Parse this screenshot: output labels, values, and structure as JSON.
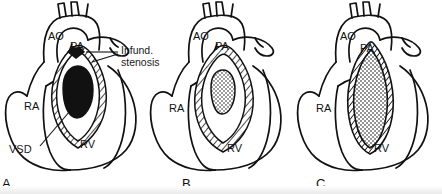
{
  "figure": {
    "background_color": "#ffffff",
    "ink_color": "#111111"
  },
  "panels": [
    {
      "id": "A",
      "letter": "A",
      "description": "Heart with large ventricular septal defect shown as solid black region and infundibular stenosis",
      "labels": {
        "aorta": "AO",
        "pulmonary_artery": "PA",
        "right_atrium": "RA",
        "right_ventricle": "RV"
      },
      "fill_style": "solid-black",
      "callouts": [
        {
          "name": "infundibular-stenosis",
          "text": "Infund.\nstenosis"
        },
        {
          "name": "ventricular-septal-defect",
          "text": "VSD"
        }
      ]
    },
    {
      "id": "B",
      "letter": "B",
      "description": "Heart with small stippled outflow chamber bounded by hatched muscular walls",
      "labels": {
        "aorta": "AO",
        "pulmonary_artery": "PA",
        "right_atrium": "RA",
        "right_ventricle": "RV"
      },
      "fill_style": "stippled-small",
      "callouts": []
    },
    {
      "id": "C",
      "letter": "C",
      "description": "Heart with large elongated stippled outflow chamber bounded by thick hatched walls",
      "labels": {
        "aorta": "AO",
        "pulmonary_artery": "PA",
        "right_atrium": "RA",
        "right_ventricle": "RV"
      },
      "fill_style": "stippled-large",
      "callouts": []
    }
  ],
  "legend": {
    "abbreviations": [
      {
        "short": "AO",
        "meaning": "Aorta"
      },
      {
        "short": "PA",
        "meaning": "Pulmonary artery"
      },
      {
        "short": "RA",
        "meaning": "Right atrium"
      },
      {
        "short": "RV",
        "meaning": "Right ventricle"
      },
      {
        "short": "VSD",
        "meaning": "Ventricular septal defect"
      }
    ]
  }
}
